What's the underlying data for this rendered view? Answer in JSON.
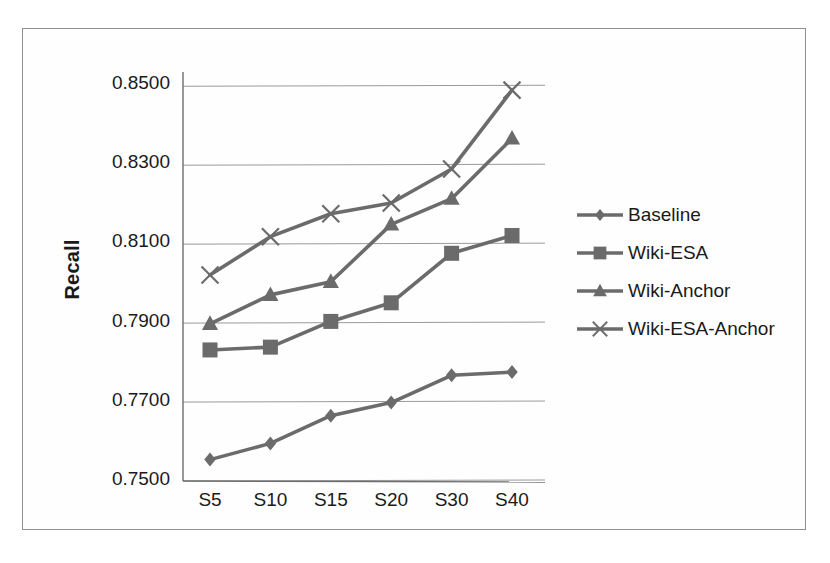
{
  "chart_data": {
    "type": "line",
    "title": "",
    "xlabel": "",
    "ylabel": "Recall",
    "categories": [
      "S5",
      "S10",
      "S15",
      "S20",
      "S30",
      "S40"
    ],
    "ylim": [
      0.75,
      0.85
    ],
    "yticks": [
      "0.7500",
      "0.7700",
      "0.7900",
      "0.8100",
      "0.8300",
      "0.8500"
    ],
    "ytick_values": [
      0.75,
      0.77,
      0.79,
      0.81,
      0.83,
      0.85
    ],
    "grid": true,
    "legend_position": "right",
    "series": [
      {
        "name": "Baseline",
        "marker": "diamond",
        "color": "#6b6b6b",
        "values": [
          0.7554,
          0.7595,
          0.7665,
          0.7698,
          0.7767,
          0.7775
        ]
      },
      {
        "name": "Wiki-ESA",
        "marker": "square",
        "color": "#6b6b6b",
        "values": [
          0.7831,
          0.7838,
          0.7903,
          0.795,
          0.8075,
          0.812
        ]
      },
      {
        "name": "Wiki-Anchor",
        "marker": "triangle",
        "color": "#6b6b6b",
        "values": [
          0.7897,
          0.797,
          0.8003,
          0.8148,
          0.8213,
          0.8365
        ]
      },
      {
        "name": "Wiki-ESA-Anchor",
        "marker": "cross",
        "color": "#6b6b6b",
        "values": [
          0.802,
          0.8117,
          0.8175,
          0.8202,
          0.8288,
          0.8487
        ]
      }
    ]
  },
  "axes": {
    "y_title": "Recall"
  },
  "legend": {
    "items": [
      {
        "label": "Baseline",
        "marker": "diamond-marker"
      },
      {
        "label": "Wiki-ESA",
        "marker": "square-marker"
      },
      {
        "label": "Wiki-Anchor",
        "marker": "triangle-marker"
      },
      {
        "label": "Wiki-ESA-Anchor",
        "marker": "cross-marker"
      }
    ]
  },
  "colors": {
    "series": "#6b6b6b",
    "grid": "#9a9a9a",
    "axis": "#6e6e6e",
    "frame": "#8f8f8f",
    "text": "#1a1a1a"
  }
}
